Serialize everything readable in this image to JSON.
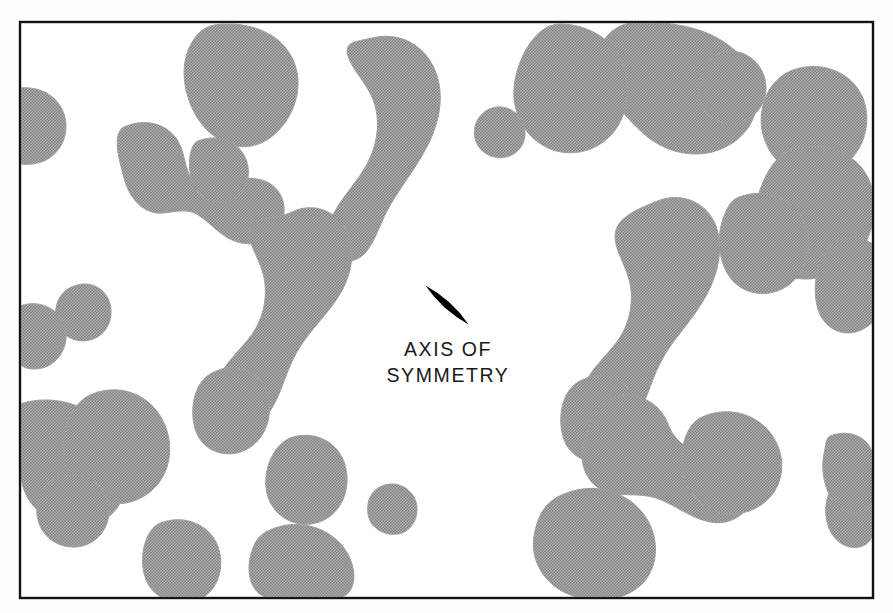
{
  "figure": {
    "kind": "technical-illustration",
    "canvas": {
      "width": 893,
      "height": 613
    },
    "frame": {
      "name": "figure-border",
      "x": 20,
      "y": 22,
      "width": 853,
      "height": 576,
      "stroke_color": "#141414",
      "stroke_width": 2.4,
      "fill_color": "#ffffff"
    },
    "background_color": "#fdfdfd",
    "blob_fill_color": "#9e9e9e",
    "blob_texture": "halftone-50-percent",
    "particle": {
      "name": "lens-particle",
      "shape": "lens",
      "fill_color": "#000000",
      "center_x": 447,
      "center_y": 305,
      "length": 58,
      "thickness": 14,
      "rotation_deg": 42
    },
    "label": {
      "name": "axis-of-symmetry-label",
      "line1": "AXIS OF",
      "line2": "SYMMETRY",
      "x": 448,
      "y1": 356,
      "y2": 382,
      "color": "#1a1a1a",
      "font_size": 19.5,
      "letter_spacing": 1.6
    },
    "blobs": [
      {
        "name": "blob-top-right-large",
        "d": "M 640 22 C 668 22 700 26 724 42 C 748 58 760 80 757 104 C 754 128 736 146 712 152 C 688 158 662 150 644 134 C 624 116 606 94 600 70 C 594 48 608 22 640 22 Z"
      },
      {
        "name": "blob-top-center",
        "d": "M 560 24 C 586 24 612 38 622 62 C 632 86 628 116 612 134 C 596 152 570 158 548 148 C 526 138 512 114 514 88 C 516 62 534 24 560 24 Z"
      },
      {
        "name": "blob-top-curl",
        "d": "M 372 38 C 396 32 420 42 432 64 C 444 86 442 112 432 136 C 422 160 404 182 392 202 C 380 222 376 240 366 252 C 356 264 340 264 332 252 C 324 240 328 222 338 206 C 348 190 362 176 370 158 C 378 140 380 120 374 102 C 368 84 352 70 348 56 C 344 42 354 42 372 38 Z"
      },
      {
        "name": "blob-top-left-mass",
        "d": "M 228 24 C 254 24 278 34 290 54 C 302 74 300 98 288 118 C 276 138 256 150 236 146 C 216 142 200 126 192 108 C 184 90 180 66 190 46 C 200 26 212 24 228 24 Z"
      },
      {
        "name": "blob-topright-small-1",
        "d": "M 722 52 C 740 48 758 58 764 76 C 770 94 762 112 746 120 C 730 128 710 122 702 106 C 694 90 700 68 712 58 Z"
      },
      {
        "name": "blob-edge-left-semicircle",
        "d": "M 20 88 C 40 86 58 96 64 114 C 70 132 62 152 46 160 C 34 166 20 164 20 164 Z"
      },
      {
        "name": "blob-left-upper-y",
        "d": "M 122 128 C 142 118 164 122 176 138 C 186 152 184 170 192 178 C 204 190 222 184 238 180 C 256 176 272 180 280 194 C 288 208 284 226 272 236 C 260 246 242 246 228 238 C 214 230 204 216 192 212 C 178 208 164 216 152 212 C 138 208 128 194 124 178 C 120 162 112 138 122 128 Z"
      },
      {
        "name": "blob-left-upper-hook",
        "d": "M 196 142 C 212 134 232 138 242 152 C 252 166 250 186 238 196 C 226 206 208 204 198 192 C 188 180 186 152 196 142 Z"
      },
      {
        "name": "blob-topmid-small",
        "d": "M 492 108 C 506 104 520 112 524 126 C 528 140 520 154 506 157 C 492 160 478 152 475 138 C 472 124 480 112 492 108 Z"
      },
      {
        "name": "blob-upper-right-pillar",
        "d": "M 800 68 C 826 62 852 74 862 96 C 872 118 866 146 848 162 C 830 178 804 180 786 168 C 768 156 758 132 762 110 C 766 88 780 72 800 68 Z"
      },
      {
        "name": "blob-right-edge-column",
        "d": "M 790 150 C 818 140 852 150 866 174 C 880 198 876 232 858 254 C 840 276 810 284 788 276 C 766 268 752 244 754 218 C 756 192 770 158 790 150 Z"
      },
      {
        "name": "blob-mid-right-vertical",
        "d": "M 840 240 C 862 232 880 244 886 266 C 892 288 884 314 868 326 C 852 338 832 334 822 318 C 812 302 814 274 822 258 C 828 246 832 243 840 240 Z"
      },
      {
        "name": "blob-center-left-S",
        "d": "M 292 212 C 312 202 336 210 346 230 C 356 250 352 274 340 294 C 328 314 310 330 298 350 C 286 370 282 392 272 408 C 262 424 244 430 230 422 C 216 414 212 394 220 376 C 228 358 246 346 256 328 C 266 310 268 288 262 270 C 256 252 246 240 250 228 C 254 216 276 220 292 212 Z"
      },
      {
        "name": "blob-center-left-S-tail",
        "d": "M 214 372 C 234 362 258 370 266 390 C 274 410 268 434 252 446 C 236 458 214 456 202 442 C 190 428 190 400 200 384 C 206 376 208 375 214 372 Z"
      },
      {
        "name": "blob-center-right-S",
        "d": "M 660 200 C 684 192 708 204 716 226 C 724 248 718 274 706 296 C 694 318 676 336 664 356 C 652 376 648 398 638 414 C 628 430 610 436 596 428 C 582 420 578 400 586 382 C 594 364 612 352 622 334 C 632 316 634 294 628 276 C 622 258 612 244 616 230 C 620 216 640 208 660 200 Z"
      },
      {
        "name": "blob-center-right-S-tail",
        "d": "M 582 380 C 602 370 626 378 634 398 C 642 418 636 442 620 454 C 604 466 582 464 570 450 C 558 436 558 408 568 392 C 574 384 576 383 582 380 Z"
      },
      {
        "name": "blob-right-mid-bump",
        "d": "M 742 196 C 768 188 794 200 804 222 C 814 244 808 270 790 284 C 772 298 748 296 734 282 C 720 268 716 242 722 222 C 728 204 732 199 742 196 Z"
      },
      {
        "name": "blob-left-teardrop-small",
        "d": "M 74 286 C 90 280 106 288 110 304 C 114 320 106 336 90 340 C 74 344 58 334 56 318 C 54 302 62 290 74 286 Z"
      },
      {
        "name": "blob-left-edge-lobe",
        "d": "M 20 306 C 36 300 54 306 62 320 C 70 334 66 352 54 362 C 42 372 24 370 20 364 Z"
      },
      {
        "name": "blob-left-big-mass",
        "d": "M 20 404 C 44 396 72 400 92 414 C 112 428 124 450 126 472 C 128 494 118 514 100 522 C 82 530 58 526 42 514 C 26 502 20 484 20 466 Z"
      },
      {
        "name": "blob-left-mid-branch",
        "d": "M 88 396 C 112 384 140 390 156 410 C 172 430 174 458 162 478 C 150 498 126 508 104 502 C 82 496 66 476 64 454 C 62 432 70 406 88 396 Z"
      },
      {
        "name": "blob-left-lower-stub",
        "d": "M 56 478 C 76 470 98 478 106 496 C 114 514 106 536 88 544 C 70 552 48 544 40 526 C 32 508 40 486 56 478 Z"
      },
      {
        "name": "blob-bottom-left-ellipse",
        "d": "M 158 524 C 180 514 206 522 216 542 C 226 562 220 588 202 598 C 184 608 158 602 148 584 C 138 566 142 534 158 524 Z"
      },
      {
        "name": "blob-bottom-mid-circle",
        "d": "M 290 438 C 312 430 336 440 344 462 C 352 484 344 510 324 520 C 304 530 280 522 270 502 C 260 482 268 448 290 438 Z"
      },
      {
        "name": "blob-bottom-tiny-circle",
        "d": "M 382 486 C 396 480 412 488 416 502 C 420 516 412 532 398 534 C 384 536 370 528 368 514 C 366 500 372 490 382 486 Z"
      },
      {
        "name": "blob-bottom-center-rounded",
        "d": "M 270 530 C 296 518 328 526 344 548 C 360 570 356 598 336 598 L 272 598 C 254 598 246 578 250 558 C 254 542 258 535 270 530 Z"
      },
      {
        "name": "blob-bottom-right-crescent",
        "d": "M 612 398 C 636 390 660 402 668 424 C 676 446 694 452 716 456 C 738 460 754 474 752 494 C 750 514 730 526 710 522 C 690 518 674 504 656 498 C 638 492 618 498 602 490 C 586 482 578 462 584 442 C 590 422 598 404 612 398 Z"
      },
      {
        "name": "blob-bottom-right-big",
        "d": "M 564 494 C 592 482 624 490 642 512 C 660 534 660 566 642 584 C 624 602 592 604 568 594 C 544 584 530 560 534 536 C 538 512 548 500 564 494 Z"
      },
      {
        "name": "blob-right-edge-lower",
        "d": "M 856 468 C 873 460 873 468 873 490 L 873 530 C 873 546 856 552 842 544 C 828 536 822 514 828 496 C 834 478 844 472 856 468 Z"
      },
      {
        "name": "blob-right-lower-small",
        "d": "M 830 436 C 850 428 872 438 873 458 L 873 494 C 873 512 854 518 840 508 C 826 498 820 472 824 454 C 826 444 826 438 830 436 Z"
      },
      {
        "name": "blob-mid-lower-right-mass",
        "d": "M 700 418 C 724 406 752 412 768 430 C 784 448 786 474 774 492 C 762 510 738 518 718 512 C 698 506 684 488 682 468 C 680 448 686 426 700 418 Z"
      }
    ]
  }
}
